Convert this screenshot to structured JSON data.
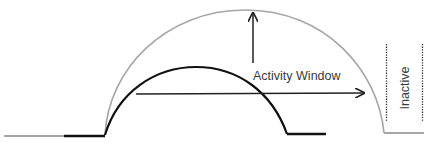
{
  "diagram": {
    "labels": {
      "activity_window": "Activity Window",
      "inactive": "Inactive"
    },
    "colors": {
      "outer_curve": "#a6a6a6",
      "inner_curve": "#111111",
      "arrow": "#222222",
      "text": "#3a3a3a",
      "dotted": "#333333"
    },
    "elements": [
      {
        "name": "outer-activity-curve",
        "description": "gray semicircular curve representing the full activity window"
      },
      {
        "name": "inner-activity-curve",
        "description": "black curve representing an inner/current activity span"
      },
      {
        "name": "vertical-arrow",
        "description": "upward arrow indicating height of activity window"
      },
      {
        "name": "horizontal-arrow",
        "description": "rightward arrow indicating width/duration of activity window"
      },
      {
        "name": "inactive-region",
        "description": "dotted-bracketed region labelled Inactive"
      }
    ]
  }
}
